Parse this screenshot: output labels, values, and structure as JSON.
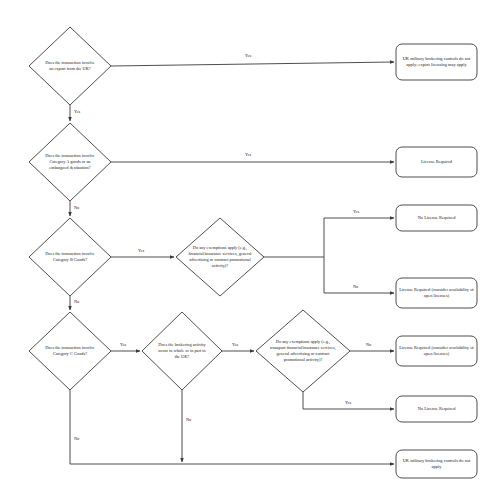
{
  "document": {
    "title": "UK Military Brokering Controls Decision Flowchart",
    "background_color": "#ffffff",
    "line_color": "#3a3a3a",
    "text_color": "#1a1a1a"
  },
  "nodes": {
    "d1_export_from_uk": "Does the transaction involve an export from the UK?",
    "d2_category_a": "Does the transaction involve Category A goods or an embargoed destination?",
    "d3_category_b": "Does the transaction involve Category B Goods?",
    "d4_exemptions_b": "Do any exemptions apply (e.g., financial/insurance services, general advertising or contract promotional activity)?",
    "d5_category_c": "Does the transaction involve Category C Goods?",
    "d6_brokering_in_uk": "Does the brokering activity occur in whole or in part in the UK?",
    "d7_exemptions_c": "Do any exemptions apply (e.g., transport financial/insurance services, general advertising or contract promotional activity)?",
    "t1_no_controls_export": "UK military brokering controls do not apply; export licensing may apply",
    "t2_license_required": "License Required",
    "t3_no_license_required": "No License Required",
    "t4_license_open": "License Required (consider availability of open licenses)",
    "t5_license_open": "License Required (consider availability of open licenses)",
    "t6_no_license_required": "No License Required",
    "t7_no_controls": "UK military brokering controls do not apply"
  },
  "edge_labels": {
    "e1_yes": "Yes",
    "e1_no": "Yes",
    "e2_yes": "Yes",
    "e2_no": "No",
    "e3_yes": "Yes",
    "e3_no": "No",
    "e4_yes": "Yes",
    "e4_no": "No",
    "e5_yes": "Yes",
    "e5_no": "No",
    "e6_yes": "Yes",
    "e6_no": "No",
    "e7_yes": "Yes",
    "e7_no": "No"
  }
}
